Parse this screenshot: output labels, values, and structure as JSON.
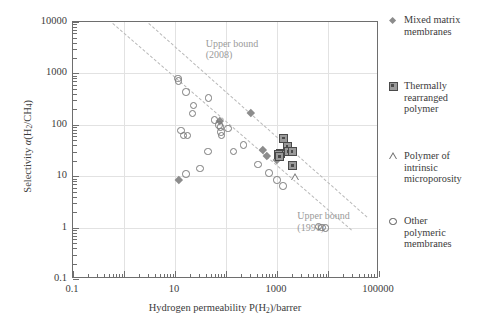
{
  "chart_data": {
    "type": "scatter",
    "title": "",
    "xlabel": "Hydrogen permeability P(H2)/barrer",
    "ylabel": "Selectivity α(H2/CH4)",
    "xscale": "log",
    "yscale": "log",
    "xlim": [
      0.1,
      100000
    ],
    "ylim": [
      0.1,
      10000
    ],
    "grid": true,
    "legend_position": "right",
    "x_ticklabels": [
      "0.1",
      "10",
      "1000",
      "100000"
    ],
    "x_tickvalues": [
      0.1,
      10,
      1000,
      100000
    ],
    "y_ticklabels": [
      "10000",
      "1000",
      "100",
      "10",
      "1",
      "0.1"
    ],
    "y_tickvalues": [
      10000,
      1000,
      100,
      10,
      1,
      0.1
    ],
    "annotations": [
      {
        "text_line1": "Upper bound",
        "text_line2": "(2008)",
        "x": 40,
        "y": 5000
      },
      {
        "text_line1": "Upper bound",
        "text_line2": "(1991)",
        "x": 2500,
        "y": 2.2
      }
    ],
    "reference_lines": [
      {
        "name": "upper-bound-2008",
        "style": "dashed",
        "color": "#b9b9b9",
        "points": [
          [
            3.1,
            9500
          ],
          [
            60000,
            1.6
          ]
        ]
      },
      {
        "name": "upper-bound-1991",
        "style": "dashed",
        "color": "#b9b9b9",
        "points": [
          [
            0.62,
            9500
          ],
          [
            30000,
            0.9
          ]
        ]
      }
    ],
    "series": [
      {
        "name": "Mixed matrix membranes",
        "marker": "diamond",
        "color": "#8c8c8c",
        "points": [
          [
            12.0,
            8.4
          ],
          [
            77,
            120
          ],
          [
            300,
            170
          ],
          [
            520,
            33
          ],
          [
            640,
            25
          ],
          [
            1000,
            21
          ]
        ]
      },
      {
        "name": "Thermally rearranged polymer",
        "marker": "square",
        "color": "#9a9a9a",
        "points": [
          [
            1350,
            55
          ],
          [
            1150,
            28
          ],
          [
            1080,
            27
          ],
          [
            1130,
            24
          ],
          [
            1600,
            38
          ],
          [
            1650,
            30
          ],
          [
            2000,
            30
          ],
          [
            2050,
            16
          ]
        ]
      },
      {
        "name": "Polymer of intrinsic microporosity",
        "marker": "triangle",
        "color": "#7a7a7a",
        "points": [
          [
            1900,
            9.5
          ]
        ]
      },
      {
        "name": "Other polymeric membranes",
        "marker": "circle",
        "color": "#7a7a7a",
        "points": [
          [
            11.5,
            800
          ],
          [
            11.8,
            720
          ],
          [
            16.5,
            440
          ],
          [
            23,
            240
          ],
          [
            22,
            165
          ],
          [
            13.0,
            78
          ],
          [
            14.5,
            62
          ],
          [
            17.5,
            62
          ],
          [
            16.5,
            11.0
          ],
          [
            31,
            14.0
          ],
          [
            44,
            30
          ],
          [
            45,
            330
          ],
          [
            60,
            125
          ],
          [
            72,
            100
          ],
          [
            78,
            90
          ],
          [
            80,
            72
          ],
          [
            82,
            62
          ],
          [
            110,
            85
          ],
          [
            140,
            30
          ],
          [
            220,
            41
          ],
          [
            420,
            17
          ],
          [
            700,
            11.5
          ],
          [
            1000,
            8.4
          ],
          [
            1300,
            6.4
          ],
          [
            6500,
            1.05
          ],
          [
            7600,
            1.0
          ],
          [
            9000,
            0.98
          ]
        ]
      }
    ]
  },
  "legend": {
    "items": [
      {
        "label_lines": [
          "Mixed matrix",
          "membranes"
        ],
        "marker": "diamond-icon"
      },
      {
        "label_lines": [
          "Thermally",
          "rearranged",
          "polymer"
        ],
        "marker": "square-icon"
      },
      {
        "label_lines": [
          "Polymer of",
          "intrinsic",
          "microporosity"
        ],
        "marker": "triangle-icon"
      },
      {
        "label_lines": [
          "Other",
          "polymeric",
          "membranes"
        ],
        "marker": "circle-icon"
      }
    ]
  },
  "axes": {
    "x_title_prefix": "Hydrogen permeability P(H",
    "x_title_sub": "2",
    "x_title_suffix": ")/barrer",
    "y_title_prefix": "Selectivity ",
    "y_title_alpha": "α",
    "y_title_open": "(H",
    "y_title_sub1": "2",
    "y_title_slash": "/CH",
    "y_title_sub2": "4",
    "y_title_close": ")"
  }
}
